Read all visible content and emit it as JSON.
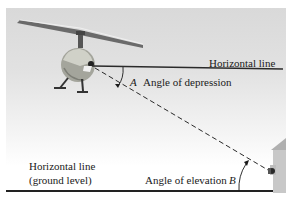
{
  "figure": {
    "horizontal_line_label": "Horizontal line",
    "angle_a_letter": "A",
    "angle_a_label": "Angle of depression",
    "ground_line_label_line1": "Horizontal line",
    "ground_line_label_line2": "(ground level)",
    "angle_b_label": "Angle of elevation",
    "angle_b_letter": "B"
  },
  "colors": {
    "sky_top": "#d9d9d9",
    "line": "#1a1a1a",
    "helicopter_body": "#a8a8a0",
    "building": "#c8c8c8"
  }
}
